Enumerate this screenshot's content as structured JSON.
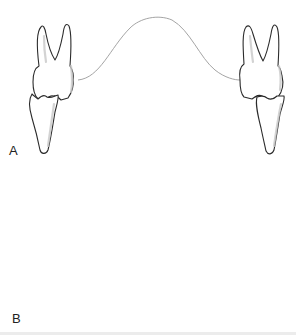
{
  "figure": {
    "panels": [
      {
        "label": "A",
        "description": "Upper and lower teeth in occlusion on both sides, connected by a curved arch line"
      },
      {
        "label": "B",
        "description": "Upper teeth with lower teeth tipped away, connected by a curved arch line"
      }
    ],
    "colors": {
      "outline": "#2b2b2b",
      "curve": "#9a9a9a",
      "background": "#ffffff"
    }
  }
}
